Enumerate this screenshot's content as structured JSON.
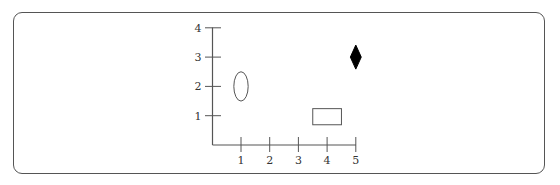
{
  "chart_data": {
    "type": "scatter",
    "title": "",
    "xlabel": "",
    "ylabel": "",
    "x_ticks": [
      "1",
      "2",
      "3",
      "4",
      "5"
    ],
    "y_ticks": [
      "1",
      "2",
      "3",
      "4"
    ],
    "xlim": [
      0,
      5
    ],
    "ylim": [
      0,
      4
    ],
    "grid": false,
    "legend": null,
    "shapes": [
      {
        "name": "ellipse",
        "type": "ellipse",
        "x": 1,
        "y": 2,
        "width": 0.5,
        "height": 1.0,
        "fill": "none",
        "stroke": "#555555"
      },
      {
        "name": "rectangle",
        "type": "rectangle",
        "x": 4,
        "y": 1,
        "width": 1.0,
        "height": 0.55,
        "fill": "none",
        "stroke": "#555555"
      },
      {
        "name": "diamond",
        "type": "diamond",
        "x": 5,
        "y": 3,
        "width": 0.38,
        "height": 0.82,
        "fill": "#000000",
        "stroke": "#000000"
      }
    ]
  },
  "axes": {
    "x_labels": [
      "1",
      "2",
      "3",
      "4",
      "5"
    ],
    "y_labels": [
      "1",
      "2",
      "3",
      "4"
    ]
  },
  "colors": {
    "axis": "#555555",
    "frame": "#555555",
    "diamond": "#000000"
  }
}
